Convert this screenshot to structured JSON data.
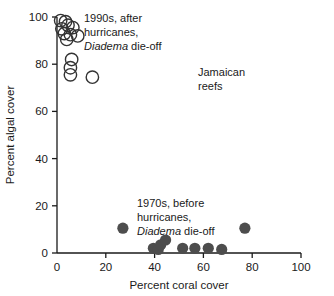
{
  "chart_data": {
    "type": "scatter",
    "title": "",
    "xlabel": "Percent coral cover",
    "ylabel": "Percent algal cover",
    "xlim": [
      0,
      100
    ],
    "ylim": [
      0,
      100
    ],
    "xticks": [
      0,
      20,
      40,
      60,
      80,
      100
    ],
    "yticks": [
      0,
      20,
      40,
      60,
      80,
      100
    ],
    "xticklabels": [
      "0",
      "20",
      "40",
      "60",
      "80",
      "100"
    ],
    "yticklabels": [
      "0",
      "20",
      "40",
      "60",
      "80",
      "100"
    ],
    "grid": false,
    "legend_position": "none",
    "series": [
      {
        "name": "1990s, after hurricanes, Diadema die-off",
        "marker": "open-circle",
        "color": "#333333",
        "fill": "none",
        "points": [
          {
            "x": 1.5,
            "y": 98.5
          },
          {
            "x": 3.5,
            "y": 98.0
          },
          {
            "x": 4.5,
            "y": 96.5
          },
          {
            "x": 2.0,
            "y": 95.0
          },
          {
            "x": 6.5,
            "y": 95.5
          },
          {
            "x": 3.0,
            "y": 93.0
          },
          {
            "x": 5.5,
            "y": 92.5
          },
          {
            "x": 8.5,
            "y": 92.0
          },
          {
            "x": 4.0,
            "y": 90.5
          },
          {
            "x": 6.0,
            "y": 82.0
          },
          {
            "x": 5.5,
            "y": 78.5
          },
          {
            "x": 5.5,
            "y": 75.5
          },
          {
            "x": 14.5,
            "y": 74.5
          }
        ]
      },
      {
        "name": "1970s, before hurricanes, Diadema die-off",
        "marker": "filled-circle",
        "color": "#4d4d4d",
        "fill": "#4d4d4d",
        "points": [
          {
            "x": 27.0,
            "y": 10.5
          },
          {
            "x": 39.5,
            "y": 2.0
          },
          {
            "x": 41.5,
            "y": 1.5
          },
          {
            "x": 42.5,
            "y": 3.5
          },
          {
            "x": 44.5,
            "y": 5.5
          },
          {
            "x": 51.5,
            "y": 2.0
          },
          {
            "x": 56.5,
            "y": 2.0
          },
          {
            "x": 62.0,
            "y": 2.0
          },
          {
            "x": 67.5,
            "y": 1.5
          },
          {
            "x": 77.0,
            "y": 10.5
          }
        ]
      }
    ],
    "annotations": [
      {
        "id": "annot-1990s",
        "lines": [
          "1990s, after",
          "hurricanes,",
          "Diadema die-off"
        ],
        "italic_lead": "Diadema",
        "italic_tail": " die-off",
        "x_px": 84,
        "y_px": 22
      },
      {
        "id": "annot-jamaican",
        "lines": [
          "Jamaican",
          "reefs"
        ],
        "x_px": 198,
        "y_px": 76
      },
      {
        "id": "annot-1970s",
        "lines": [
          "1970s, before",
          "hurricanes,",
          "Diadema die-off"
        ],
        "italic_lead": "Diadema",
        "italic_tail": " die-off",
        "x_px": 137,
        "y_px": 207
      }
    ]
  },
  "axis": {
    "x_title": "Percent coral cover",
    "y_title": "Percent algal cover",
    "x_ticks": [
      "0",
      "20",
      "40",
      "60",
      "80",
      "100"
    ],
    "y_ticks": [
      "0",
      "20",
      "40",
      "60",
      "80",
      "100"
    ]
  },
  "annot_1990s": {
    "line1": "1990s, after",
    "line2": "hurricanes,",
    "line3_italic": "Diadema",
    "line3_rest": " die-off"
  },
  "annot_jamaican": {
    "line1": "Jamaican",
    "line2": "reefs"
  },
  "annot_1970s": {
    "line1": "1970s, before",
    "line2": "hurricanes,",
    "line3_italic": "Diadema",
    "line3_rest": " die-off"
  },
  "colors": {
    "axis": "#1a1a1a",
    "open_marker_stroke": "#333333",
    "filled_marker": "#4d4d4d",
    "background": "#ffffff"
  }
}
